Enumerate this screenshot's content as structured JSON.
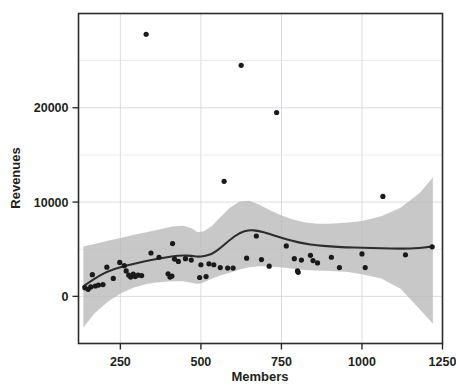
{
  "chart_data": {
    "type": "scatter",
    "title": "",
    "xlabel": "Members",
    "ylabel": "Revenues",
    "xlim": [
      120,
      1250
    ],
    "ylim": [
      -5000,
      30000
    ],
    "xticks": [
      250,
      500,
      750,
      1000,
      1250
    ],
    "yticks": [
      0,
      10000,
      20000
    ],
    "xtick_labels": [
      "250",
      "500",
      "750",
      "1000",
      "1250"
    ],
    "ytick_labels": [
      "0",
      "10000",
      "20000"
    ],
    "grid": true,
    "legend": "none",
    "points": [
      [
        140,
        900
      ],
      [
        150,
        750
      ],
      [
        158,
        1000
      ],
      [
        163,
        2300
      ],
      [
        172,
        1100
      ],
      [
        182,
        1200
      ],
      [
        196,
        1250
      ],
      [
        208,
        3100
      ],
      [
        228,
        1900
      ],
      [
        248,
        3600
      ],
      [
        262,
        3250
      ],
      [
        268,
        2700
      ],
      [
        276,
        2250
      ],
      [
        282,
        2050
      ],
      [
        290,
        2350
      ],
      [
        296,
        2100
      ],
      [
        305,
        2250
      ],
      [
        316,
        2200
      ],
      [
        330,
        27800
      ],
      [
        345,
        4600
      ],
      [
        370,
        4150
      ],
      [
        398,
        2400
      ],
      [
        404,
        2050
      ],
      [
        410,
        2150
      ],
      [
        412,
        5600
      ],
      [
        418,
        3950
      ],
      [
        430,
        3700
      ],
      [
        452,
        4000
      ],
      [
        470,
        3850
      ],
      [
        496,
        2000
      ],
      [
        500,
        3350
      ],
      [
        516,
        2100
      ],
      [
        525,
        3450
      ],
      [
        540,
        3350
      ],
      [
        560,
        3050
      ],
      [
        572,
        12200
      ],
      [
        583,
        3000
      ],
      [
        600,
        3000
      ],
      [
        625,
        24500
      ],
      [
        642,
        4050
      ],
      [
        672,
        6400
      ],
      [
        688,
        3900
      ],
      [
        712,
        3200
      ],
      [
        735,
        19500
      ],
      [
        765,
        5350
      ],
      [
        790,
        4000
      ],
      [
        800,
        2700
      ],
      [
        802,
        2550
      ],
      [
        812,
        3850
      ],
      [
        840,
        4350
      ],
      [
        848,
        3800
      ],
      [
        862,
        3550
      ],
      [
        905,
        4150
      ],
      [
        930,
        3050
      ],
      [
        1000,
        4500
      ],
      [
        1010,
        3050
      ],
      [
        1065,
        10600
      ],
      [
        1135,
        4400
      ],
      [
        1218,
        5250
      ]
    ],
    "smooth_line": [
      [
        135,
        1050
      ],
      [
        170,
        1900
      ],
      [
        210,
        2650
      ],
      [
        250,
        3100
      ],
      [
        290,
        3450
      ],
      [
        330,
        3750
      ],
      [
        370,
        4000
      ],
      [
        410,
        4250
      ],
      [
        445,
        4350
      ],
      [
        470,
        4300
      ],
      [
        490,
        4200
      ],
      [
        510,
        4250
      ],
      [
        535,
        4500
      ],
      [
        560,
        5100
      ],
      [
        590,
        6000
      ],
      [
        620,
        6750
      ],
      [
        650,
        7050
      ],
      [
        680,
        6950
      ],
      [
        710,
        6650
      ],
      [
        745,
        6250
      ],
      [
        780,
        5900
      ],
      [
        820,
        5600
      ],
      [
        860,
        5400
      ],
      [
        900,
        5300
      ],
      [
        950,
        5200
      ],
      [
        1000,
        5150
      ],
      [
        1060,
        5100
      ],
      [
        1120,
        5050
      ],
      [
        1180,
        5100
      ],
      [
        1220,
        5300
      ]
    ],
    "ci_upper": [
      [
        135,
        5300
      ],
      [
        170,
        5550
      ],
      [
        210,
        5900
      ],
      [
        250,
        6200
      ],
      [
        290,
        6500
      ],
      [
        330,
        6800
      ],
      [
        370,
        7100
      ],
      [
        410,
        7400
      ],
      [
        445,
        7500
      ],
      [
        470,
        7250
      ],
      [
        490,
        6800
      ],
      [
        510,
        6900
      ],
      [
        535,
        7500
      ],
      [
        560,
        8400
      ],
      [
        590,
        9400
      ],
      [
        620,
        10050
      ],
      [
        650,
        10150
      ],
      [
        680,
        9750
      ],
      [
        710,
        9200
      ],
      [
        745,
        8650
      ],
      [
        780,
        8200
      ],
      [
        820,
        7850
      ],
      [
        860,
        7700
      ],
      [
        900,
        7700
      ],
      [
        950,
        7800
      ],
      [
        1000,
        8000
      ],
      [
        1060,
        8500
      ],
      [
        1120,
        9400
      ],
      [
        1180,
        11000
      ],
      [
        1220,
        12600
      ]
    ],
    "ci_lower": [
      [
        135,
        -3300
      ],
      [
        170,
        -1800
      ],
      [
        210,
        -600
      ],
      [
        250,
        300
      ],
      [
        290,
        900
      ],
      [
        330,
        1300
      ],
      [
        370,
        1500
      ],
      [
        410,
        1600
      ],
      [
        445,
        1600
      ],
      [
        470,
        1450
      ],
      [
        490,
        1300
      ],
      [
        510,
        1500
      ],
      [
        535,
        1900
      ],
      [
        560,
        2200
      ],
      [
        590,
        2500
      ],
      [
        620,
        2850
      ],
      [
        650,
        3100
      ],
      [
        680,
        3200
      ],
      [
        710,
        3200
      ],
      [
        745,
        3100
      ],
      [
        780,
        2950
      ],
      [
        820,
        2800
      ],
      [
        860,
        2750
      ],
      [
        900,
        2700
      ],
      [
        950,
        2600
      ],
      [
        1000,
        2350
      ],
      [
        1060,
        1900
      ],
      [
        1120,
        800
      ],
      [
        1180,
        -1400
      ],
      [
        1220,
        -2900
      ]
    ]
  }
}
